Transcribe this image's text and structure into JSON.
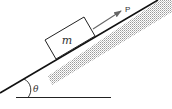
{
  "diagram": {
    "type": "inclined-plane",
    "labels": {
      "mass": "m",
      "force": "P",
      "angle": "θ"
    },
    "colors": {
      "line": "#111111",
      "arrow": "#666666",
      "stipple": "#9a9a9a",
      "text": "#333333"
    }
  }
}
